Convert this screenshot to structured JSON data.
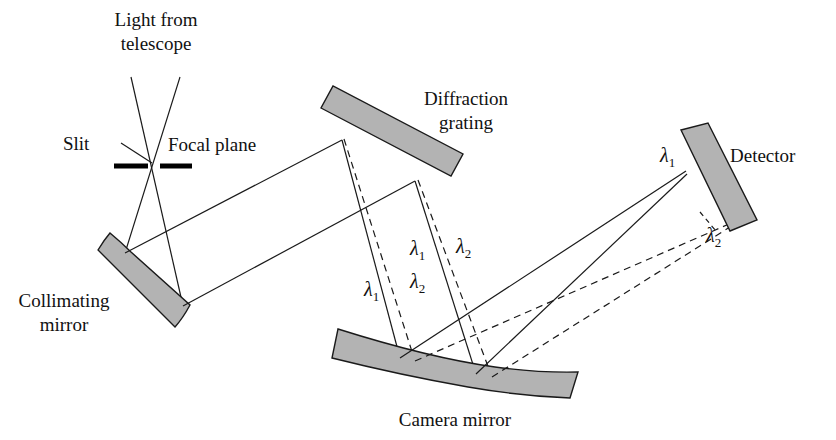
{
  "figure": {
    "kind": "optical-ray-diagram",
    "title_text": "",
    "background_color": "#ffffff",
    "line_color": "#1a1a1a",
    "component_fill": "#b3b3b3",
    "component_stroke": "#1a1a1a",
    "slit_bar_color": "#000000"
  },
  "labels": {
    "light_from_telescope_line1": "Light from",
    "light_from_telescope_line2": "telescope",
    "slit": "Slit",
    "focal_plane": "Focal plane",
    "collimating_mirror_line1": "Collimating",
    "collimating_mirror_line2": "mirror",
    "diffraction_grating_line1": "Diffraction",
    "diffraction_grating_line2": "grating",
    "camera_mirror": "Camera mirror",
    "detector": "Detector"
  },
  "wavelength_labels": {
    "lambda": "λ",
    "grating_left_1": "1",
    "grating_left_2": "2",
    "grating_right_1": "1",
    "grating_right_2": "2",
    "detector_1": "1",
    "detector_2": "2"
  },
  "components": [
    {
      "name": "collimating-mirror",
      "type": "concave-mirror",
      "label": "Collimating mirror"
    },
    {
      "name": "diffraction-grating",
      "type": "flat-grating",
      "label": "Diffraction grating"
    },
    {
      "name": "camera-mirror",
      "type": "concave-mirror",
      "label": "Camera mirror"
    },
    {
      "name": "detector",
      "type": "flat-detector",
      "label": "Detector"
    },
    {
      "name": "focal-plane-slit",
      "type": "slit",
      "label": "Slit"
    }
  ],
  "ray_sets": [
    {
      "name": "incoming-telescope-beam",
      "style": "solid",
      "description": "converging beam from telescope through slit"
    },
    {
      "name": "collimated-beam-to-grating",
      "style": "solid",
      "description": "parallel beam from collimating mirror to grating"
    },
    {
      "name": "lambda1-dispersed-beam",
      "style": "solid",
      "description": "first wavelength from grating to camera mirror to detector"
    },
    {
      "name": "lambda2-dispersed-beam",
      "style": "dashed",
      "description": "second wavelength from grating to camera mirror to detector"
    }
  ]
}
